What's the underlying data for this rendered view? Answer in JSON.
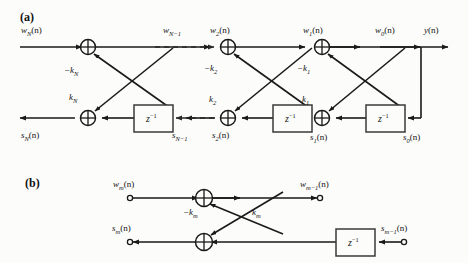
{
  "figure": {
    "type": "signal-flow-diagram",
    "panels": [
      {
        "id": "a",
        "label": "(a)",
        "x": 20,
        "y": 10
      },
      {
        "id": "b",
        "label": "(b)",
        "x": 25,
        "y": 176
      }
    ]
  },
  "panel_a": {
    "signal_labels": {
      "w_N": "w",
      "w_N_sub": "N",
      "w_N_arg": "(n)",
      "w_Nm1": "w",
      "w_Nm1_sub": "N−1",
      "w_2": "w",
      "w_2_sub": "2",
      "w_2_arg": "(n)",
      "w_1": "w",
      "w_1_sub": "1",
      "w_1_arg": "(n)",
      "w_0": "w",
      "w_0_sub": "0",
      "w_0_arg": "(n)",
      "y": "y",
      "y_arg": "(n)",
      "s_N": "s",
      "s_N_sub": "N",
      "s_N_arg": "(n)",
      "s_Nm1": "s",
      "s_Nm1_sub": "N−1",
      "s_2": "s",
      "s_2_sub": "2",
      "s_2_arg": "(n)",
      "s_1": "s",
      "s_1_sub": "1",
      "s_1_arg": "(n)",
      "s_0": "s",
      "s_0_sub": "0",
      "s_0_arg": "(n)"
    },
    "coefficients": [
      {
        "name": "minus-k-N",
        "text": "−k",
        "sub": "N",
        "x": 64,
        "y": 66
      },
      {
        "name": "k-N",
        "text": "k",
        "sub": "N",
        "x": 69,
        "y": 93
      },
      {
        "name": "minus-k-2",
        "text": "−k",
        "sub": "2",
        "x": 204,
        "y": 64
      },
      {
        "name": "k-2",
        "text": "k",
        "sub": "2",
        "x": 209,
        "y": 95
      },
      {
        "name": "minus-k-1",
        "text": "−k",
        "sub": "1",
        "x": 297,
        "y": 64
      },
      {
        "name": "k-1",
        "text": "k",
        "sub": "1",
        "x": 302,
        "y": 95
      }
    ],
    "delay_blocks": [
      {
        "name": "delay-block-N",
        "text": "z",
        "sup": "−1",
        "x": 134,
        "y": 105,
        "w": 39,
        "h": 27
      },
      {
        "name": "delay-block-1",
        "text": "z",
        "sup": "−1",
        "x": 273,
        "y": 105,
        "w": 39,
        "h": 27
      },
      {
        "name": "delay-block-0",
        "text": "z",
        "sup": "−1",
        "x": 366,
        "y": 105,
        "w": 39,
        "h": 27
      }
    ],
    "adders": [
      {
        "name": "adder-top-N",
        "cx": 88,
        "cy": 47
      },
      {
        "name": "adder-bot-N",
        "cx": 88,
        "cy": 118
      },
      {
        "name": "adder-top-2",
        "cx": 228,
        "cy": 47
      },
      {
        "name": "adder-bot-2",
        "cx": 228,
        "cy": 118
      },
      {
        "name": "adder-top-1",
        "cx": 322,
        "cy": 47
      },
      {
        "name": "adder-bot-1",
        "cx": 322,
        "cy": 118
      }
    ]
  },
  "panel_b": {
    "signal_labels": {
      "w_m": "w",
      "w_m_sub": "m",
      "w_m_arg": "(n)",
      "w_mm1": "w",
      "w_mm1_sub": "m−1",
      "w_mm1_arg": "(n)",
      "s_m": "s",
      "s_m_sub": "m",
      "s_m_arg": "(n)",
      "s_mm1": "s",
      "s_mm1_sub": "m−1",
      "s_mm1_arg": "(n)"
    },
    "coefficients": [
      {
        "name": "minus-k-m",
        "text": "−k",
        "sub": "m",
        "x": 183,
        "y": 210
      },
      {
        "name": "k-m",
        "text": "k",
        "sub": "m",
        "x": 252,
        "y": 210
      }
    ],
    "delay_blocks": [
      {
        "name": "delay-block-m",
        "text": "z",
        "sup": "−1",
        "x": 336,
        "y": 229,
        "w": 39,
        "h": 27
      }
    ],
    "adders": [
      {
        "name": "adder-top-m",
        "cx": 204,
        "cy": 198
      },
      {
        "name": "adder-bot-m",
        "cx": 204,
        "cy": 242
      }
    ],
    "terminals": [
      {
        "name": "terminal-w-m-input",
        "cx": 130,
        "cy": 198
      },
      {
        "name": "terminal-w-m-1-output",
        "cx": 320,
        "cy": 198
      },
      {
        "name": "terminal-s-m-output",
        "cx": 130,
        "cy": 242
      },
      {
        "name": "terminal-s-m-1-input",
        "cx": 404,
        "cy": 242
      }
    ]
  },
  "style": {
    "line_color": "#1a1a1a",
    "dashed_color": "#2a2a2a",
    "box_stroke": "#3a3a3a",
    "background": "#fcfcfa"
  }
}
